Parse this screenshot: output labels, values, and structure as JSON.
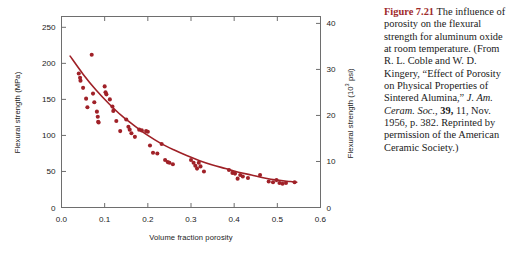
{
  "figure": {
    "number_label": "Figure 7.21",
    "caption_segments": [
      {
        "text": "Figure 7.21",
        "style": "figure-number"
      },
      {
        "text": "  The influence of porosity on the flexural strength for aluminum oxide at room temperature. (From R. L. Coble and W. D. Kingery, “Effect of Porosity on Physical Properties of Sintered Alumina,” ",
        "style": "normal"
      },
      {
        "text": "J. Am. Ceram. Soc., ",
        "style": "italic"
      },
      {
        "text": "39,",
        "style": "bold"
      },
      {
        "text": " 11, Nov. 1956, p. 382. Reprinted by permission of the American Ceramic Society.)",
        "style": "normal"
      }
    ],
    "caption_plain": "Figure 7.21  The influence of porosity on the flexural strength for aluminum oxide at room temperature. (From R. L. Coble and W. D. Kingery, “Effect of Porosity on Physical Properties of Sintered Alumina,” J. Am. Ceram. Soc., 39, 11, Nov. 1956, p. 382. Reprinted by permission of the American Ceramic Society.)"
  },
  "colors": {
    "data_red": "#a02128",
    "curve_red": "#9e2026",
    "axis_gray": "#6e6e6e",
    "text_black": "#1a1a1a",
    "figure_number_red": "#9e2a2b",
    "background": "#ffffff"
  },
  "chart_data": {
    "type": "scatter",
    "title": "",
    "xlabel": "Volume fraction porosity",
    "ylabel": "Flexural strength (MPa)",
    "ylabel_secondary": "Flexural strength (10³ psi)",
    "xlim": [
      0.0,
      0.6
    ],
    "ylim": [
      0,
      265
    ],
    "ylim_secondary": [
      0,
      40
    ],
    "xticks": [
      0.0,
      0.1,
      0.2,
      0.3,
      0.4,
      0.5,
      0.6
    ],
    "xticklabels": [
      "0.0",
      "0.1",
      "0.2",
      "0.3",
      "0.4",
      "0.5",
      "0.6"
    ],
    "yticks": [
      0,
      50,
      100,
      150,
      200,
      250
    ],
    "yticklabels": [
      "0",
      "50",
      "100",
      "150",
      "200",
      "250"
    ],
    "yticks_secondary": [
      0,
      10,
      20,
      30,
      40
    ],
    "yticklabels_secondary": [
      "0",
      "10",
      "20",
      "30",
      "40"
    ],
    "grid": false,
    "legend": null,
    "points": [
      [
        0.04,
        186.0
      ],
      [
        0.043,
        180.0
      ],
      [
        0.044,
        176.0
      ],
      [
        0.05,
        166.0
      ],
      [
        0.057,
        151.0
      ],
      [
        0.06,
        139.0
      ],
      [
        0.07,
        212.0
      ],
      [
        0.073,
        158.0
      ],
      [
        0.076,
        146.0
      ],
      [
        0.082,
        133.0
      ],
      [
        0.084,
        126.0
      ],
      [
        0.085,
        119.0
      ],
      [
        0.086,
        118.0
      ],
      [
        0.1,
        168.0
      ],
      [
        0.102,
        160.0
      ],
      [
        0.104,
        157.0
      ],
      [
        0.112,
        150.0
      ],
      [
        0.118,
        140.0
      ],
      [
        0.12,
        134.0
      ],
      [
        0.127,
        120.0
      ],
      [
        0.136,
        106.0
      ],
      [
        0.15,
        122.0
      ],
      [
        0.155,
        112.0
      ],
      [
        0.158,
        108.0
      ],
      [
        0.162,
        103.0
      ],
      [
        0.17,
        98.0
      ],
      [
        0.18,
        108.0
      ],
      [
        0.186,
        107.0
      ],
      [
        0.196,
        106.0
      ],
      [
        0.2,
        105.0
      ],
      [
        0.205,
        86.0
      ],
      [
        0.212,
        76.0
      ],
      [
        0.222,
        75.0
      ],
      [
        0.232,
        88.0
      ],
      [
        0.24,
        66.0
      ],
      [
        0.246,
        63.0
      ],
      [
        0.25,
        62.0
      ],
      [
        0.258,
        60.0
      ],
      [
        0.3,
        66.0
      ],
      [
        0.306,
        62.0
      ],
      [
        0.31,
        58.0
      ],
      [
        0.314,
        54.0
      ],
      [
        0.318,
        62.0
      ],
      [
        0.322,
        57.0
      ],
      [
        0.33,
        50.0
      ],
      [
        0.388,
        52.0
      ],
      [
        0.396,
        48.0
      ],
      [
        0.402,
        47.0
      ],
      [
        0.408,
        40.0
      ],
      [
        0.414,
        45.0
      ],
      [
        0.42,
        43.0
      ],
      [
        0.432,
        41.0
      ],
      [
        0.46,
        45.0
      ],
      [
        0.48,
        36.0
      ],
      [
        0.49,
        35.0
      ],
      [
        0.498,
        38.0
      ],
      [
        0.505,
        34.0
      ],
      [
        0.512,
        33.0
      ],
      [
        0.52,
        34.0
      ],
      [
        0.54,
        35.0
      ]
    ],
    "fit_curve": {
      "description": "exponential decay trend line",
      "points": [
        [
          0.02,
          210.0
        ],
        [
          0.05,
          185.0
        ],
        [
          0.08,
          163.0
        ],
        [
          0.11,
          144.0
        ],
        [
          0.14,
          127.0
        ],
        [
          0.17,
          113.0
        ],
        [
          0.2,
          100.0
        ],
        [
          0.23,
          89.0
        ],
        [
          0.26,
          80.0
        ],
        [
          0.29,
          72.0
        ],
        [
          0.32,
          65.0
        ],
        [
          0.35,
          59.0
        ],
        [
          0.38,
          54.0
        ],
        [
          0.41,
          49.0
        ],
        [
          0.44,
          45.0
        ],
        [
          0.47,
          41.0
        ],
        [
          0.5,
          38.0
        ],
        [
          0.53,
          36.0
        ],
        [
          0.545,
          35.0
        ]
      ]
    }
  }
}
